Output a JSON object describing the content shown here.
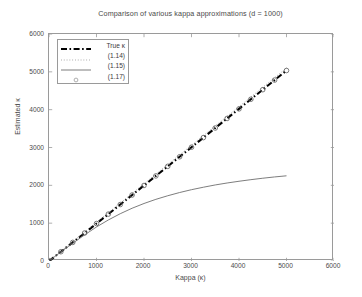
{
  "chart_data": {
    "type": "line",
    "title": "Comparison of various kappa approximations (d = 1000)",
    "xlabel": "Kappa (κ)",
    "ylabel": "Estimated κ",
    "xlim": [
      0,
      6000
    ],
    "ylim": [
      0,
      6000
    ],
    "xticks": [
      "0",
      "1000",
      "2000",
      "3000",
      "4000",
      "5000",
      "6000"
    ],
    "yticks": [
      "0",
      "1000",
      "2000",
      "3000",
      "4000",
      "5000",
      "6000"
    ],
    "xtick_values": [
      0,
      1000,
      2000,
      3000,
      4000,
      5000,
      6000
    ],
    "ytick_values": [
      0,
      1000,
      2000,
      3000,
      4000,
      5000,
      6000
    ],
    "grid": false,
    "legend_position": "upper-left",
    "x": [
      0,
      250,
      500,
      750,
      1000,
      1250,
      1500,
      1750,
      2000,
      2250,
      2500,
      2750,
      3000,
      3250,
      3500,
      3750,
      4000,
      4250,
      4500,
      4750,
      5000
    ],
    "series": [
      {
        "name": "True κ",
        "style": "dash-dot",
        "color": "#000000",
        "width": 2.1,
        "values": [
          0,
          245,
          492,
          740,
          990,
          1240,
          1492,
          1744,
          1996,
          2249,
          2502,
          2755,
          3008,
          3261,
          3515,
          3768,
          4021,
          4275,
          4528,
          4782,
          5035
        ]
      },
      {
        "name": "(1.14)",
        "style": "dotted",
        "color": "#8a8a8a",
        "width": 0.9,
        "values": [
          0,
          255,
          510,
          765,
          1020,
          1275,
          1530,
          1785,
          2040,
          2295,
          2550,
          2805,
          3060,
          3315,
          3570,
          3825,
          4080,
          4335,
          4590,
          4845,
          5100
        ]
      },
      {
        "name": "(1.15)",
        "style": "solid",
        "color": "#6e6e6e",
        "width": 0.9,
        "values": [
          0,
          240,
          470,
          690,
          900,
          1085,
          1250,
          1395,
          1520,
          1630,
          1725,
          1810,
          1885,
          1950,
          2010,
          2062,
          2108,
          2150,
          2188,
          2222,
          2252
        ]
      },
      {
        "name": "(1.17)",
        "style": "circle-markers",
        "color": "#5a5a5a",
        "width": 0.9,
        "values": [
          0,
          245,
          492,
          740,
          990,
          1240,
          1492,
          1744,
          1996,
          2249,
          2502,
          2755,
          3008,
          3261,
          3515,
          3768,
          4021,
          4275,
          4528,
          4782,
          5035
        ]
      }
    ]
  },
  "legend": {
    "items": [
      {
        "label": "True κ",
        "marker": "dash-dot-line-icon"
      },
      {
        "label": "(1.14)",
        "marker": "dotted-line-icon"
      },
      {
        "label": "(1.15)",
        "marker": "solid-line-icon"
      },
      {
        "label": "(1.17)",
        "marker": "circle-marker-icon"
      }
    ]
  }
}
